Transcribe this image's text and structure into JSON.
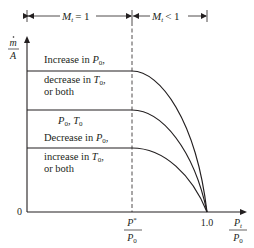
{
  "diagram": {
    "type": "mass-flux-vs-pressure-ratio",
    "colors": {
      "ink": "#231f20",
      "background": "#ffffff"
    },
    "regions": [
      {
        "label_var": "M",
        "label_sub": "t",
        "label_rel": "= 1"
      },
      {
        "label_var": "M",
        "label_sub": "t",
        "label_rel": "< 1"
      }
    ],
    "y_axis": {
      "num": "m",
      "den": "A"
    },
    "x_axis": {
      "origin": "0",
      "tick_one": "1.0",
      "critical": {
        "num_var": "P",
        "num_sup": "*",
        "den_var": "P",
        "den_sub": "0"
      },
      "label": {
        "num_var": "P",
        "num_sub": "t",
        "den_var": "P",
        "den_sub": "0"
      }
    },
    "curves": [
      {
        "line1_text": "Increase in ",
        "line1_var": "P",
        "line1_sub": "0",
        "line1_tail": ",",
        "line2_text": "decrease in ",
        "line2_var": "T",
        "line2_sub": "0",
        "line2_tail": ",",
        "line3_text": "or both"
      },
      {
        "var1": "P",
        "sub1": "0",
        "sep": ", ",
        "var2": "T",
        "sub2": "0"
      },
      {
        "line1_text": "Decrease in ",
        "line1_var": "P",
        "line1_sub": "0",
        "line1_tail": ",",
        "line2_text": "increase in ",
        "line2_var": "T",
        "line2_sub": "0",
        "line2_tail": ",",
        "line3_text": "or both"
      }
    ]
  }
}
